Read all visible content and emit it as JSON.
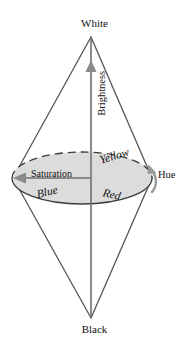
{
  "figure": {
    "background_color": "#ffffff",
    "stroke_color": "#555555",
    "disc_fill_color": "#dcdcdc",
    "axis_arrow_color": "#8a8a8a",
    "text_color": "#111111"
  },
  "labels": {
    "white": "White",
    "black": "Black",
    "brightness": "Brightness",
    "saturation": "Saturation",
    "hue": "Hue",
    "yellow": "Yellow",
    "blue": "Blue",
    "red": "Red"
  },
  "geometry": {
    "top_apex": {
      "x": 91,
      "y": 37
    },
    "bottom_apex": {
      "x": 91,
      "y": 318
    },
    "disc_center": {
      "x": 82,
      "y": 178
    },
    "disc_radius_x": 70,
    "disc_radius_y": 26,
    "disc_left_edge": {
      "x": 12,
      "y": 178
    },
    "disc_right_edge": {
      "x": 152,
      "y": 178
    },
    "brightness_arrow_tip": {
      "x": 91,
      "y": 62
    },
    "brightness_arrow_tail": {
      "x": 91,
      "y": 178
    },
    "saturation_arrow_tip": {
      "x": 14,
      "y": 178
    },
    "saturation_arrow_tail": {
      "x": 91,
      "y": 178
    },
    "hue_arrow_arc": "curved arrow around right rim of disc"
  },
  "icons": {
    "brightness_axis": "up-arrow-icon",
    "saturation_axis": "left-arrow-icon",
    "hue_axis": "curved-arrow-icon"
  }
}
